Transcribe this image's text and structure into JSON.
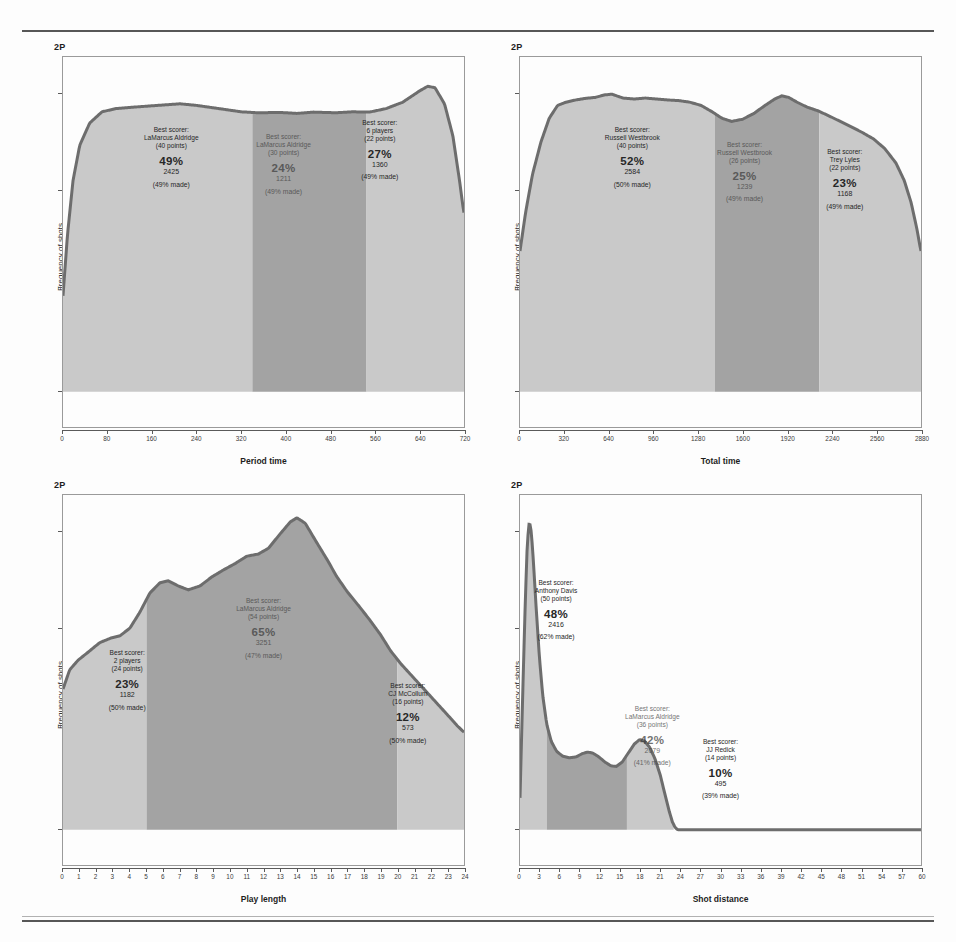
{
  "figure": {
    "panel_tag": "2P",
    "ylabel": "Frequency of shots"
  },
  "chart_data": [
    {
      "type": "area",
      "title": "2P",
      "xlabel": "Period time",
      "ylabel": "Frequency of shots",
      "xlim": [
        0,
        720
      ],
      "xticks": [
        0,
        80,
        160,
        240,
        320,
        400,
        480,
        560,
        640,
        720
      ],
      "ylim": [
        0,
        1
      ],
      "grid": false,
      "legend": "none",
      "segments": [
        {
          "range": [
            0,
            340
          ],
          "shade": "light",
          "best_scorer_label": "Best scorer:",
          "best_scorer_name": "LaMarcus Aldridge",
          "best_scorer_points": "(40 points)",
          "percent": "49%",
          "count": "2425",
          "made": "(49% made)"
        },
        {
          "range": [
            340,
            545
          ],
          "shade": "dark",
          "best_scorer_label": "Best scorer:",
          "best_scorer_name": "LaMarcus Aldridge",
          "best_scorer_points": "(30 points)",
          "percent": "24%",
          "count": "1211",
          "made": "(49% made)"
        },
        {
          "range": [
            545,
            720
          ],
          "shade": "light",
          "best_scorer_label": "Best scorer:",
          "best_scorer_name": "6 players",
          "best_scorer_points": "(22 points)",
          "percent": "27%",
          "count": "1360",
          "made": "(49% made)"
        }
      ],
      "curve": [
        [
          0,
          0.3
        ],
        [
          8,
          0.49
        ],
        [
          18,
          0.66
        ],
        [
          30,
          0.77
        ],
        [
          48,
          0.84
        ],
        [
          70,
          0.875
        ],
        [
          95,
          0.885
        ],
        [
          130,
          0.89
        ],
        [
          170,
          0.895
        ],
        [
          210,
          0.9
        ],
        [
          240,
          0.895
        ],
        [
          280,
          0.885
        ],
        [
          320,
          0.875
        ],
        [
          350,
          0.872
        ],
        [
          390,
          0.873
        ],
        [
          420,
          0.87
        ],
        [
          450,
          0.874
        ],
        [
          490,
          0.872
        ],
        [
          520,
          0.875
        ],
        [
          550,
          0.874
        ],
        [
          580,
          0.885
        ],
        [
          610,
          0.905
        ],
        [
          640,
          0.94
        ],
        [
          655,
          0.955
        ],
        [
          668,
          0.95
        ],
        [
          685,
          0.9
        ],
        [
          700,
          0.8
        ],
        [
          712,
          0.66
        ],
        [
          718,
          0.58
        ],
        [
          720,
          0.56
        ]
      ]
    },
    {
      "type": "area",
      "title": "2P",
      "xlabel": "Total time",
      "ylabel": "Frequency of shots",
      "xlim": [
        0,
        2880
      ],
      "xticks": [
        0,
        320,
        640,
        960,
        1280,
        1600,
        1920,
        2240,
        2560,
        2880
      ],
      "ylim": [
        0,
        1
      ],
      "grid": false,
      "legend": "none",
      "segments": [
        {
          "range": [
            0,
            1400
          ],
          "shade": "light",
          "best_scorer_label": "Best scorer:",
          "best_scorer_name": "Russell Westbrook",
          "best_scorer_points": "(40 points)",
          "percent": "52%",
          "count": "2584",
          "made": "(50% made)"
        },
        {
          "range": [
            1400,
            2150
          ],
          "shade": "dark",
          "best_scorer_label": "Best scorer:",
          "best_scorer_name": "Russell Westbrook",
          "best_scorer_points": "(26 points)",
          "percent": "25%",
          "count": "1239",
          "made": "(49% made)"
        },
        {
          "range": [
            2150,
            2880
          ],
          "shade": "light",
          "best_scorer_label": "Best scorer:",
          "best_scorer_name": "Trey Lyles",
          "best_scorer_points": "(22 points)",
          "percent": "23%",
          "count": "1168",
          "made": "(49% made)"
        }
      ],
      "curve": [
        [
          0,
          0.44
        ],
        [
          40,
          0.56
        ],
        [
          90,
          0.68
        ],
        [
          150,
          0.78
        ],
        [
          210,
          0.855
        ],
        [
          270,
          0.895
        ],
        [
          330,
          0.905
        ],
        [
          400,
          0.912
        ],
        [
          470,
          0.917
        ],
        [
          540,
          0.92
        ],
        [
          610,
          0.928
        ],
        [
          660,
          0.93
        ],
        [
          740,
          0.918
        ],
        [
          820,
          0.915
        ],
        [
          900,
          0.918
        ],
        [
          980,
          0.915
        ],
        [
          1060,
          0.912
        ],
        [
          1140,
          0.91
        ],
        [
          1220,
          0.905
        ],
        [
          1300,
          0.895
        ],
        [
          1380,
          0.875
        ],
        [
          1450,
          0.855
        ],
        [
          1520,
          0.845
        ],
        [
          1600,
          0.852
        ],
        [
          1680,
          0.87
        ],
        [
          1760,
          0.895
        ],
        [
          1830,
          0.915
        ],
        [
          1880,
          0.925
        ],
        [
          1930,
          0.92
        ],
        [
          1990,
          0.905
        ],
        [
          2060,
          0.89
        ],
        [
          2140,
          0.878
        ],
        [
          2220,
          0.862
        ],
        [
          2300,
          0.845
        ],
        [
          2380,
          0.828
        ],
        [
          2460,
          0.81
        ],
        [
          2540,
          0.79
        ],
        [
          2620,
          0.76
        ],
        [
          2700,
          0.715
        ],
        [
          2760,
          0.66
        ],
        [
          2810,
          0.59
        ],
        [
          2850,
          0.51
        ],
        [
          2875,
          0.45
        ],
        [
          2880,
          0.44
        ]
      ]
    },
    {
      "type": "area",
      "title": "2P",
      "xlabel": "Play length",
      "ylabel": "Frequency of shots",
      "xlim": [
        0,
        24
      ],
      "xticks": [
        0,
        1,
        2,
        3,
        4,
        5,
        6,
        7,
        8,
        9,
        10,
        11,
        12,
        13,
        14,
        15,
        16,
        17,
        18,
        19,
        20,
        21,
        22,
        23,
        24
      ],
      "ylim": [
        0,
        1
      ],
      "grid": false,
      "legend": "none",
      "segments": [
        {
          "range": [
            0,
            5
          ],
          "shade": "light",
          "best_scorer_label": "Best scorer:",
          "best_scorer_name": "2 players",
          "best_scorer_points": "(24 points)",
          "percent": "23%",
          "count": "1182",
          "made": "(50% made)"
        },
        {
          "range": [
            5,
            20
          ],
          "shade": "dark",
          "best_scorer_label": "Best scorer:",
          "best_scorer_name": "LaMarcus Aldridge",
          "best_scorer_points": "(54 points)",
          "percent": "65%",
          "count": "3251",
          "made": "(47% made)"
        },
        {
          "range": [
            20,
            24
          ],
          "shade": "light",
          "best_scorer_label": "Best scorer:",
          "best_scorer_name": "CJ McCollum",
          "best_scorer_points": "(16 points)",
          "percent": "12%",
          "count": "573",
          "made": "(50% made)"
        }
      ],
      "curve": [
        [
          0,
          0.44
        ],
        [
          0.4,
          0.5
        ],
        [
          0.9,
          0.53
        ],
        [
          1.5,
          0.555
        ],
        [
          2.2,
          0.585
        ],
        [
          2.9,
          0.6
        ],
        [
          3.4,
          0.606
        ],
        [
          4.0,
          0.63
        ],
        [
          4.6,
          0.68
        ],
        [
          5.2,
          0.74
        ],
        [
          5.8,
          0.772
        ],
        [
          6.3,
          0.778
        ],
        [
          6.9,
          0.762
        ],
        [
          7.5,
          0.75
        ],
        [
          8.2,
          0.762
        ],
        [
          8.9,
          0.79
        ],
        [
          9.6,
          0.812
        ],
        [
          10.3,
          0.832
        ],
        [
          11.0,
          0.855
        ],
        [
          11.7,
          0.862
        ],
        [
          12.3,
          0.88
        ],
        [
          13.0,
          0.925
        ],
        [
          13.6,
          0.962
        ],
        [
          14.0,
          0.975
        ],
        [
          14.5,
          0.958
        ],
        [
          15.1,
          0.905
        ],
        [
          15.8,
          0.845
        ],
        [
          16.4,
          0.79
        ],
        [
          17.0,
          0.745
        ],
        [
          17.7,
          0.7
        ],
        [
          18.3,
          0.66
        ],
        [
          19.0,
          0.61
        ],
        [
          19.6,
          0.56
        ],
        [
          20.2,
          0.52
        ],
        [
          20.9,
          0.48
        ],
        [
          21.6,
          0.44
        ],
        [
          22.3,
          0.4
        ],
        [
          23.0,
          0.36
        ],
        [
          23.6,
          0.325
        ],
        [
          24,
          0.305
        ]
      ]
    },
    {
      "type": "area",
      "title": "2P",
      "xlabel": "Shot distance",
      "ylabel": "Frequency of shots",
      "xlim": [
        0,
        60
      ],
      "xticks": [
        0,
        3,
        6,
        9,
        12,
        15,
        18,
        21,
        24,
        27,
        30,
        33,
        36,
        39,
        42,
        45,
        48,
        51,
        54,
        57,
        60
      ],
      "ylim": [
        0,
        1
      ],
      "grid": false,
      "legend": "none",
      "segments": [
        {
          "range": [
            0,
            4
          ],
          "shade": "light",
          "best_scorer_label": "Best scorer:",
          "best_scorer_name": "Anthony Davis",
          "best_scorer_points": "(50 points)",
          "percent": "48%",
          "count": "2416",
          "made": "(62% made)"
        },
        {
          "range": [
            4,
            16
          ],
          "shade": "dark",
          "best_scorer_label": "Best scorer:",
          "best_scorer_name": "LaMarcus Aldridge",
          "best_scorer_points": "(36 points)",
          "percent": "42%",
          "count": "2079",
          "made": "(41% made)"
        },
        {
          "range": [
            16,
            23
          ],
          "shade": "light",
          "best_scorer_label": "Best scorer:",
          "best_scorer_name": "JJ Redick",
          "best_scorer_points": "(14 points)",
          "percent": "10%",
          "count": "495",
          "made": "(39% made)"
        }
      ],
      "curve": [
        [
          0,
          0.1
        ],
        [
          0.4,
          0.42
        ],
        [
          0.8,
          0.72
        ],
        [
          1.1,
          0.9
        ],
        [
          1.4,
          0.965
        ],
        [
          1.7,
          0.93
        ],
        [
          2.0,
          0.84
        ],
        [
          2.4,
          0.7
        ],
        [
          2.9,
          0.54
        ],
        [
          3.4,
          0.42
        ],
        [
          4.0,
          0.33
        ],
        [
          4.7,
          0.275
        ],
        [
          5.5,
          0.245
        ],
        [
          6.4,
          0.23
        ],
        [
          7.4,
          0.225
        ],
        [
          8.4,
          0.228
        ],
        [
          9.3,
          0.238
        ],
        [
          10.1,
          0.243
        ],
        [
          10.9,
          0.24
        ],
        [
          11.8,
          0.228
        ],
        [
          12.7,
          0.212
        ],
        [
          13.6,
          0.2
        ],
        [
          14.4,
          0.198
        ],
        [
          15.3,
          0.212
        ],
        [
          16.2,
          0.24
        ],
        [
          17.1,
          0.268
        ],
        [
          17.9,
          0.282
        ],
        [
          18.6,
          0.278
        ],
        [
          19.4,
          0.258
        ],
        [
          20.2,
          0.222
        ],
        [
          21.0,
          0.17
        ],
        [
          21.7,
          0.11
        ],
        [
          22.3,
          0.06
        ],
        [
          22.8,
          0.025
        ],
        [
          23.2,
          0.008
        ],
        [
          23.6,
          0.0
        ],
        [
          60,
          0.0
        ]
      ]
    }
  ],
  "annotation_positions": [
    [
      {
        "left": "27%",
        "top": "27%"
      },
      {
        "left": "55%",
        "top": "29%"
      },
      {
        "left": "79%",
        "top": "25%"
      }
    ],
    [
      {
        "left": "28%",
        "top": "27%"
      },
      {
        "left": "56%",
        "top": "31%"
      },
      {
        "left": "81%",
        "top": "33%"
      }
    ],
    [
      {
        "left": "16%",
        "top": "50%"
      },
      {
        "left": "50%",
        "top": "36%"
      },
      {
        "left": "86%",
        "top": "59%"
      }
    ],
    [
      {
        "left": "9%",
        "top": "31%"
      },
      {
        "left": "33%",
        "top": "65%"
      },
      {
        "left": "50%",
        "top": "74%"
      }
    ]
  ],
  "colors": {
    "light_fill": "#c9c9c9",
    "dark_fill": "#a3a3a3",
    "curve_stroke": "#6d6d6d",
    "frame": "#9a9a9a",
    "text": "#272727"
  }
}
